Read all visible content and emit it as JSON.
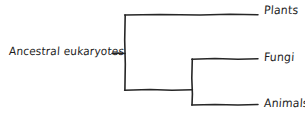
{
  "diagram": {
    "type": "cladogram",
    "title": "",
    "style": "hand-drawn",
    "colors": {
      "background": "#ffffff",
      "stroke": "#262626",
      "text": "#1c1c1c"
    },
    "root": {
      "label": "Ancestral eukaryotes"
    },
    "tips": [
      {
        "id": "plants",
        "label": "Plants"
      },
      {
        "id": "fungi",
        "label": "Fungi"
      },
      {
        "id": "animals",
        "label": "Animals"
      }
    ],
    "nodes": [
      {
        "id": "node-1",
        "x": 125,
        "y_top": 15,
        "y_bottom": 90
      },
      {
        "id": "node-2",
        "x": 192,
        "y_top": 59,
        "y_bottom": 105
      }
    ],
    "branches": [
      {
        "id": "root-stem",
        "x1": 112,
        "y1": 53,
        "x2": 125,
        "y2": 53
      },
      {
        "id": "branch-plants",
        "x1": 125,
        "y1": 15,
        "x2": 258,
        "y2": 15
      },
      {
        "id": "branch-internal",
        "x1": 125,
        "y1": 90,
        "x2": 192,
        "y2": 90
      },
      {
        "id": "branch-fungi",
        "x1": 192,
        "y1": 59,
        "x2": 258,
        "y2": 59
      },
      {
        "id": "branch-animals",
        "x1": 192,
        "y1": 105,
        "x2": 258,
        "y2": 105
      }
    ]
  }
}
